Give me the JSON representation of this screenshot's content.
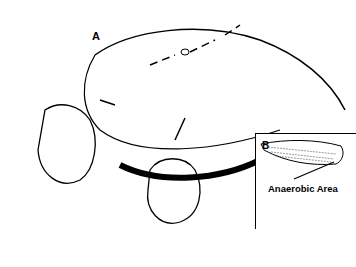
{
  "illustration": {
    "description": "Line drawing of hands probing a wound with clamps on a rounded body part; inset B showing a wound tract with anaerobic area",
    "labels": {
      "panel_a": "A",
      "panel_b": "B",
      "annotation": "Anaerobic Area"
    }
  }
}
